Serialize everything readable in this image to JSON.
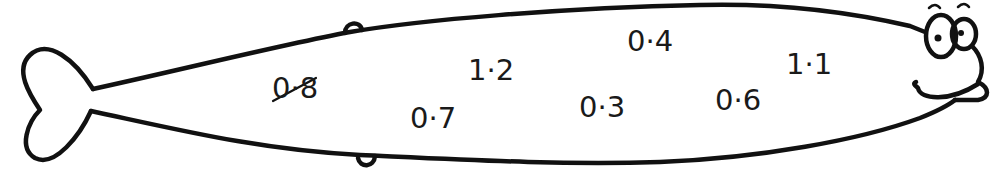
{
  "worksheet": {
    "figure": "fish",
    "numbers": [
      {
        "label": "0·8",
        "value": 0.8,
        "crossed_out": true,
        "x": 272,
        "y": 74
      },
      {
        "label": "0·7",
        "value": 0.7,
        "crossed_out": false,
        "x": 410,
        "y": 104
      },
      {
        "label": "1·2",
        "value": 1.2,
        "crossed_out": false,
        "x": 468,
        "y": 56
      },
      {
        "label": "0·3",
        "value": 0.3,
        "crossed_out": false,
        "x": 579,
        "y": 93
      },
      {
        "label": "0·4",
        "value": 0.4,
        "crossed_out": false,
        "x": 627,
        "y": 27
      },
      {
        "label": "0·6",
        "value": 0.6,
        "crossed_out": false,
        "x": 715,
        "y": 86
      },
      {
        "label": "1·1",
        "value": 1.1,
        "crossed_out": false,
        "x": 786,
        "y": 50
      }
    ],
    "colors": {
      "ink": "#111111",
      "background": "#ffffff"
    }
  }
}
